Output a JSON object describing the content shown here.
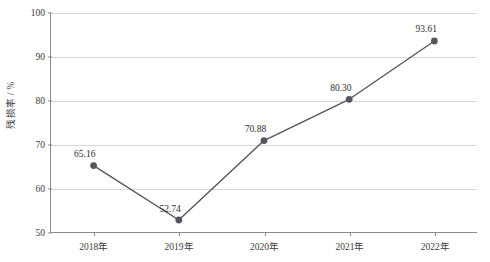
{
  "chart_data": {
    "type": "line",
    "title": "",
    "subtitle": "",
    "xlabel": "",
    "ylabel": "残损率 / %",
    "categories": [
      "2018年",
      "2019年",
      "2020年",
      "2021年",
      "2022年"
    ],
    "values": [
      65.16,
      52.74,
      70.88,
      80.3,
      93.61
    ],
    "point_labels": [
      "65.16",
      "52.74",
      "70.88",
      "80.30",
      "93.61"
    ],
    "series": [
      {
        "name": "残损率",
        "values": [
          65.16,
          52.74,
          70.88,
          80.3,
          93.61
        ]
      }
    ],
    "ylim": [
      50,
      100
    ],
    "y_ticks": [
      50,
      60,
      70,
      80,
      90,
      100
    ],
    "y_tick_labels": [
      "50",
      "60",
      "70",
      "80",
      "90",
      "100"
    ],
    "x_tick_labels": [
      "2018年",
      "2019年",
      "2020年",
      "2021年",
      "2022年"
    ],
    "grid": true,
    "grid_axis": "y",
    "legend": false,
    "legend_position": "none",
    "marker": "circle",
    "colors": {
      "line": "#55555f",
      "marker": "#55555f",
      "grid": "#d6d6d6",
      "axis": "#8a8a8a",
      "text": "#2e2e2e",
      "background": "#ffffff"
    }
  }
}
